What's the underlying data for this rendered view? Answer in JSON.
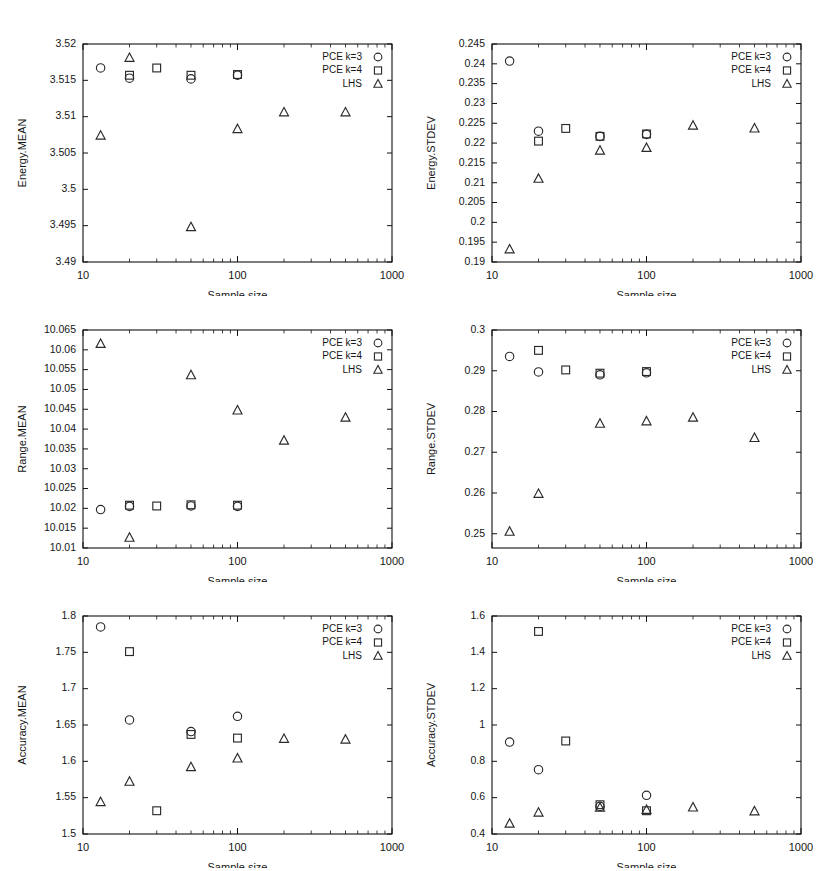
{
  "figure": {
    "background": "#ffffff",
    "marker_color": "#2a2a2a",
    "axis_color": "#111111",
    "columns": 2,
    "rows": 3
  },
  "legend": {
    "entries": [
      {
        "label": "PCE k=3",
        "marker": "circle"
      },
      {
        "label": "PCE k=4",
        "marker": "square"
      },
      {
        "label": "LHS",
        "marker": "triangle"
      }
    ]
  },
  "common": {
    "xlabel": "Sample size",
    "xticklabels": [
      "10",
      "100",
      "1000"
    ],
    "xlim": [
      10,
      1000
    ],
    "xscale": "log"
  },
  "chart_data": [
    {
      "id": "energy-mean",
      "type": "scatter",
      "title": "",
      "xlabel": "Sample size",
      "ylabel": "Energy.MEAN",
      "xscale": "log",
      "xlim": [
        10,
        1000
      ],
      "ylim": [
        3.49,
        3.52
      ],
      "yticks": [
        3.49,
        3.495,
        3.5,
        3.505,
        3.51,
        3.515,
        3.52
      ],
      "yticklabels": [
        "3.49",
        "3.495",
        "3.5",
        "3.505",
        "3.51",
        "3.515",
        "3.52"
      ],
      "xticks": [
        10,
        100,
        1000
      ],
      "xticklabels": [
        "10",
        "100",
        "1000"
      ],
      "grid": false,
      "legend_position": "top-right",
      "series": [
        {
          "name": "PCE k=3",
          "marker": "circle",
          "x": [
            13,
            20,
            50,
            100
          ],
          "y": [
            3.5167,
            3.5153,
            3.5152,
            3.5157
          ]
        },
        {
          "name": "PCE k=4",
          "marker": "square",
          "x": [
            20,
            30,
            50,
            100
          ],
          "y": [
            3.5157,
            3.5167,
            3.5157,
            3.5158
          ]
        },
        {
          "name": "LHS",
          "marker": "triangle",
          "x": [
            13,
            20,
            50,
            100,
            200,
            500
          ],
          "y": [
            3.5074,
            3.5181,
            3.4948,
            3.5083,
            3.5106,
            3.5106
          ]
        }
      ]
    },
    {
      "id": "energy-stdev",
      "type": "scatter",
      "title": "",
      "xlabel": "Sample size",
      "ylabel": "Energy.STDEV",
      "xscale": "log",
      "xlim": [
        10,
        1000
      ],
      "ylim": [
        0.19,
        0.245
      ],
      "yticks": [
        0.19,
        0.195,
        0.2,
        0.205,
        0.21,
        0.215,
        0.22,
        0.225,
        0.23,
        0.235,
        0.24,
        0.245
      ],
      "yticklabels": [
        "0.19",
        "0.195",
        "0.2",
        "0.205",
        "0.21",
        "0.215",
        "0.22",
        "0.225",
        "0.23",
        "0.235",
        "0.24",
        "0.245"
      ],
      "xticks": [
        10,
        100,
        1000
      ],
      "xticklabels": [
        "10",
        "100",
        "1000"
      ],
      "grid": false,
      "legend_position": "top-right",
      "series": [
        {
          "name": "PCE k=3",
          "marker": "circle",
          "x": [
            13,
            20,
            50,
            100
          ],
          "y": [
            0.2407,
            0.223,
            0.2217,
            0.2222
          ]
        },
        {
          "name": "PCE k=4",
          "marker": "square",
          "x": [
            20,
            30,
            50,
            100
          ],
          "y": [
            0.2205,
            0.2237,
            0.2217,
            0.2223
          ]
        },
        {
          "name": "LHS",
          "marker": "triangle",
          "x": [
            13,
            20,
            50,
            100,
            200,
            500
          ],
          "y": [
            0.1932,
            0.211,
            0.2181,
            0.2188,
            0.2244,
            0.2237
          ]
        }
      ]
    },
    {
      "id": "range-mean",
      "type": "scatter",
      "title": "",
      "xlabel": "Sample size",
      "ylabel": "Range.MEAN",
      "xscale": "log",
      "xlim": [
        10,
        1000
      ],
      "ylim": [
        10.01,
        10.065
      ],
      "yticks": [
        10.01,
        10.015,
        10.02,
        10.025,
        10.03,
        10.035,
        10.04,
        10.045,
        10.05,
        10.055,
        10.06,
        10.065
      ],
      "yticklabels": [
        "10.01",
        "10.015",
        "10.02",
        "10.025",
        "10.03",
        "10.035",
        "10.04",
        "10.045",
        "10.05",
        "10.055",
        "10.06",
        "10.065"
      ],
      "xticks": [
        10,
        100,
        1000
      ],
      "xticklabels": [
        "10",
        "100",
        "1000"
      ],
      "grid": false,
      "legend_position": "top-right",
      "series": [
        {
          "name": "PCE k=3",
          "marker": "circle",
          "x": [
            13,
            20,
            50,
            100
          ],
          "y": [
            10.0197,
            10.0205,
            10.0206,
            10.0205
          ]
        },
        {
          "name": "PCE k=4",
          "marker": "square",
          "x": [
            20,
            30,
            50,
            100
          ],
          "y": [
            10.0208,
            10.0206,
            10.0209,
            10.0208
          ]
        },
        {
          "name": "LHS",
          "marker": "triangle",
          "x": [
            13,
            20,
            50,
            100,
            200,
            500
          ],
          "y": [
            10.0615,
            10.0126,
            10.0536,
            10.0447,
            10.0371,
            10.0429
          ]
        }
      ]
    },
    {
      "id": "range-stdev",
      "type": "scatter",
      "title": "",
      "xlabel": "Sample size",
      "ylabel": "Range.STDEV",
      "xscale": "log",
      "xlim": [
        10,
        1000
      ],
      "ylim": [
        0.2465,
        0.3
      ],
      "yticks": [
        0.25,
        0.26,
        0.27,
        0.28,
        0.29,
        0.3
      ],
      "yticklabels": [
        "0.25",
        "0.26",
        "0.27",
        "0.28",
        "0.29",
        "0.3"
      ],
      "xticks": [
        10,
        100,
        1000
      ],
      "xticklabels": [
        "10",
        "100",
        "1000"
      ],
      "grid": false,
      "legend_position": "top-right",
      "series": [
        {
          "name": "PCE k=3",
          "marker": "circle",
          "x": [
            13,
            20,
            50,
            100
          ],
          "y": [
            0.2935,
            0.2897,
            0.289,
            0.2895
          ]
        },
        {
          "name": "PCE k=4",
          "marker": "square",
          "x": [
            20,
            30,
            50,
            100
          ],
          "y": [
            0.295,
            0.2902,
            0.2894,
            0.2898
          ]
        },
        {
          "name": "LHS",
          "marker": "triangle",
          "x": [
            13,
            20,
            50,
            100,
            200,
            500
          ],
          "y": [
            0.2505,
            0.2598,
            0.277,
            0.2776,
            0.2785,
            0.2735
          ]
        }
      ]
    },
    {
      "id": "accuracy-mean",
      "type": "scatter",
      "title": "",
      "xlabel": "Sample size",
      "ylabel": "Accuracy.MEAN",
      "xscale": "log",
      "xlim": [
        10,
        1000
      ],
      "ylim": [
        1.5,
        1.8
      ],
      "yticks": [
        1.5,
        1.55,
        1.6,
        1.65,
        1.7,
        1.75,
        1.8
      ],
      "yticklabels": [
        "1.5",
        "1.55",
        "1.6",
        "1.65",
        "1.7",
        "1.75",
        "1.8"
      ],
      "xticks": [
        10,
        100,
        1000
      ],
      "xticklabels": [
        "10",
        "100",
        "1000"
      ],
      "grid": false,
      "legend_position": "top-right",
      "series": [
        {
          "name": "PCE k=3",
          "marker": "circle",
          "x": [
            13,
            20,
            50,
            100
          ],
          "y": [
            1.785,
            1.657,
            1.641,
            1.662
          ]
        },
        {
          "name": "PCE k=4",
          "marker": "square",
          "x": [
            20,
            30,
            50,
            100
          ],
          "y": [
            1.751,
            1.532,
            1.637,
            1.632
          ]
        },
        {
          "name": "LHS",
          "marker": "triangle",
          "x": [
            13,
            20,
            50,
            100,
            200,
            500
          ],
          "y": [
            1.544,
            1.572,
            1.592,
            1.604,
            1.631,
            1.63
          ]
        }
      ]
    },
    {
      "id": "accuracy-stdev",
      "type": "scatter",
      "title": "",
      "xlabel": "Sample size",
      "ylabel": "Accuracy.STDEV",
      "xscale": "log",
      "xlim": [
        10,
        1000
      ],
      "ylim": [
        0.4,
        1.6
      ],
      "yticks": [
        0.4,
        0.6,
        0.8,
        1.0,
        1.2,
        1.4,
        1.6
      ],
      "yticklabels": [
        "0.4",
        "0.6",
        "0.8",
        "1",
        "1.2",
        "1.4",
        "1.6"
      ],
      "xticks": [
        10,
        100,
        1000
      ],
      "xticklabels": [
        "10",
        "100",
        "1000"
      ],
      "grid": false,
      "legend_position": "top-right",
      "series": [
        {
          "name": "PCE k=3",
          "marker": "circle",
          "x": [
            13,
            20,
            50,
            100
          ],
          "y": [
            0.906,
            0.754,
            0.552,
            0.613
          ]
        },
        {
          "name": "PCE k=4",
          "marker": "square",
          "x": [
            20,
            30,
            50,
            100
          ],
          "y": [
            1.515,
            0.912,
            0.561,
            0.528
          ]
        },
        {
          "name": "LHS",
          "marker": "triangle",
          "x": [
            13,
            20,
            50,
            100,
            200,
            500
          ],
          "y": [
            0.457,
            0.518,
            0.545,
            0.533,
            0.546,
            0.525
          ]
        }
      ]
    }
  ]
}
